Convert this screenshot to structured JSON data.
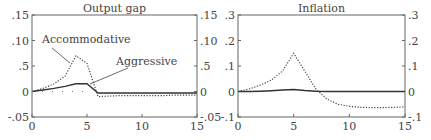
{
  "chart_data": [
    {
      "type": "line",
      "title": "Output gap",
      "xlabel": "",
      "ylabel": "",
      "xlim": [
        0,
        15
      ],
      "ylim": [
        -0.05,
        0.15
      ],
      "x_ticks": [
        "0",
        "5",
        "10",
        "15"
      ],
      "y_ticks": [
        "-.05",
        "0",
        ".5",
        ".10",
        ".15"
      ],
      "y_tick_values": [
        -0.05,
        0,
        0.05,
        0.1,
        0.15
      ],
      "grid": false,
      "annotations": [
        "Accommodative",
        "Aggressive"
      ],
      "series": [
        {
          "name": "Accommodative",
          "style": "dotted",
          "x": [
            0,
            1,
            2,
            3,
            4,
            5,
            6,
            7,
            8,
            9,
            10,
            11,
            12,
            13,
            14,
            15
          ],
          "y": [
            0,
            0.006,
            0.015,
            0.03,
            0.07,
            0.055,
            -0.01,
            -0.009,
            -0.008,
            -0.008,
            -0.008,
            -0.008,
            -0.008,
            -0.007,
            -0.007,
            -0.007
          ]
        },
        {
          "name": "Aggressive",
          "style": "solid",
          "x": [
            0,
            1,
            2,
            3,
            4,
            5,
            6,
            7,
            8,
            9,
            10,
            11,
            12,
            13,
            14,
            15
          ],
          "y": [
            0,
            0.003,
            0.006,
            0.01,
            0.015,
            0.015,
            -0.003,
            -0.003,
            -0.003,
            -0.003,
            -0.003,
            -0.003,
            -0.003,
            -0.003,
            -0.003,
            -0.003
          ]
        },
        {
          "name": "Zero reference",
          "style": "sparse-dotted",
          "x": [
            0,
            1,
            2,
            3,
            4,
            5
          ],
          "y": [
            0,
            0,
            0,
            0,
            0,
            0
          ]
        }
      ]
    },
    {
      "type": "line",
      "title": "Inflation",
      "xlabel": "",
      "ylabel": "",
      "xlim": [
        0,
        15
      ],
      "ylim": [
        -0.1,
        0.3
      ],
      "x_ticks": [
        "0",
        "5",
        "10",
        "15"
      ],
      "y_ticks": [
        "-.1",
        "0",
        ".1",
        ".2",
        ".3"
      ],
      "y_tick_values": [
        -0.1,
        0,
        0.1,
        0.2,
        0.3
      ],
      "grid": false,
      "series": [
        {
          "name": "Accommodative",
          "style": "dotted",
          "x": [
            0,
            1,
            2,
            3,
            4,
            5,
            6,
            7,
            8,
            9,
            10,
            11,
            12,
            13,
            14,
            15
          ],
          "y": [
            0,
            0.01,
            0.025,
            0.045,
            0.08,
            0.15,
            0.08,
            0.01,
            -0.03,
            -0.05,
            -0.058,
            -0.062,
            -0.063,
            -0.063,
            -0.062,
            -0.06
          ]
        },
        {
          "name": "Aggressive",
          "style": "solid",
          "x": [
            0,
            1,
            2,
            3,
            4,
            5,
            6,
            7,
            8,
            9,
            10,
            11,
            12,
            13,
            14,
            15
          ],
          "y": [
            0,
            0,
            0.001,
            0.003,
            0.006,
            0.008,
            0.004,
            0.001,
            0,
            0,
            0,
            0,
            0,
            0,
            0,
            0
          ]
        }
      ]
    }
  ]
}
